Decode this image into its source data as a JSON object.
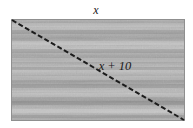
{
  "figure": {
    "kind": "geometry-diagram",
    "background_color": "#ffffff",
    "labels": {
      "top_side": "x",
      "interior_diagonal_label": "x + 10"
    },
    "rectangle": {
      "x": 11,
      "y": 19,
      "width": 174,
      "height": 102,
      "fill_base_color": "#a9a9a9",
      "border_color": "#8c8c8c"
    },
    "diagonal": {
      "x1": 12,
      "y1": 20,
      "x2": 184,
      "y2": 120,
      "color": "#1c1c1c",
      "style": "dashed",
      "width": 2
    },
    "top_label_position": {
      "x": 96,
      "y": 13
    },
    "interior_label_position": {
      "x": 115,
      "y": 69
    },
    "texture": {
      "type": "horizontal-scanlines",
      "band_count": 9,
      "light_color": "#c6c6c6",
      "dark_color": "#8f8f8f",
      "noise_opacity": 0.35
    }
  }
}
